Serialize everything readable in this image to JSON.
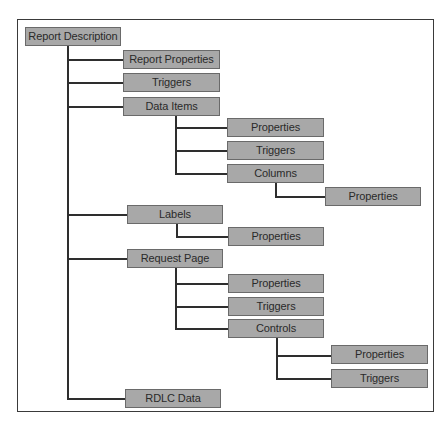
{
  "diagram": {
    "colors": {
      "node_fill": "#a8a8a8",
      "node_border": "#6a6a6a",
      "connector": "#2e2e2e",
      "frame": "#3a3a3a",
      "text": "#2a2a2a"
    },
    "root": {
      "label": "Report Description",
      "children": [
        {
          "label": "Report Properties"
        },
        {
          "label": "Triggers"
        },
        {
          "label": "Data Items",
          "children": [
            {
              "label": "Properties"
            },
            {
              "label": "Triggers"
            },
            {
              "label": "Columns",
              "children": [
                {
                  "label": "Properties"
                }
              ]
            }
          ]
        },
        {
          "label": "Labels",
          "children": [
            {
              "label": "Properties"
            }
          ]
        },
        {
          "label": "Request Page",
          "children": [
            {
              "label": "Properties"
            },
            {
              "label": "Triggers"
            },
            {
              "label": "Controls",
              "children": [
                {
                  "label": "Properties"
                },
                {
                  "label": "Triggers"
                }
              ]
            }
          ]
        },
        {
          "label": "RDLC Data"
        }
      ]
    }
  }
}
